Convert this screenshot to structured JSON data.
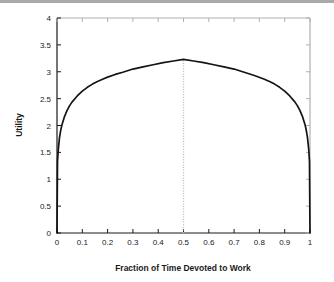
{
  "figure": {
    "background_color": "#ffffff",
    "top_band_color": "#a9a9a9",
    "frame_color": "#b0b0b0",
    "axis_color": "#1a1a1a"
  },
  "chart_data": {
    "type": "line",
    "title": "",
    "subtitle": "",
    "xlabel": "Fraction of Time Devoted to Work",
    "ylabel": "Utility",
    "xlim": [
      0,
      1
    ],
    "ylim": [
      0,
      4
    ],
    "grid": false,
    "legend": null,
    "legend_position": "none",
    "xticks": [
      0,
      0.1,
      0.2,
      0.3,
      0.4,
      0.5,
      0.6,
      0.7,
      0.8,
      0.9,
      1
    ],
    "xticklabels": [
      "0",
      "0.1",
      "0.2",
      "0.3",
      "0.4",
      "0.5",
      "0.6",
      "0.7",
      "0.8",
      "0.9",
      "1"
    ],
    "yticks": [
      0,
      0.5,
      1,
      1.5,
      2,
      2.5,
      3,
      3.5,
      4
    ],
    "yticklabels": [
      "0",
      "0.5",
      "1",
      "1.5",
      "2",
      "2.5",
      "3",
      "3.5",
      "4"
    ],
    "series": [
      {
        "name": "Utility",
        "color": "#141414",
        "linewidth": 1.7,
        "linestyle": "solid",
        "x": [
          0.0,
          0.002,
          0.005,
          0.01,
          0.015,
          0.02,
          0.03,
          0.04,
          0.05,
          0.06,
          0.08,
          0.1,
          0.12,
          0.14,
          0.16,
          0.18,
          0.2,
          0.23,
          0.26,
          0.3,
          0.34,
          0.38,
          0.42,
          0.46,
          0.5,
          0.54,
          0.58,
          0.62,
          0.66,
          0.7,
          0.74,
          0.78,
          0.82,
          0.84,
          0.86,
          0.88,
          0.9,
          0.92,
          0.94,
          0.95,
          0.96,
          0.97,
          0.98,
          0.985,
          0.99,
          0.995,
          0.998,
          1.0
        ],
        "y": [
          0.0,
          1.33,
          1.55,
          1.78,
          1.92,
          2.02,
          2.17,
          2.28,
          2.37,
          2.44,
          2.55,
          2.64,
          2.71,
          2.77,
          2.82,
          2.86,
          2.9,
          2.95,
          2.99,
          3.05,
          3.09,
          3.13,
          3.17,
          3.2,
          3.23,
          3.2,
          3.17,
          3.13,
          3.09,
          3.05,
          2.99,
          2.93,
          2.86,
          2.82,
          2.77,
          2.71,
          2.64,
          2.55,
          2.44,
          2.37,
          2.28,
          2.17,
          2.02,
          1.92,
          1.78,
          1.55,
          1.33,
          0.0
        ]
      }
    ],
    "annotations": [
      {
        "name": "optimum-marker",
        "type": "vertical-line",
        "x": 0.5,
        "y_from": 0,
        "y_to": 3.23,
        "linestyle": "dotted",
        "color": "#b8b8b8",
        "label": ""
      }
    ],
    "peak": {
      "x": 0.5,
      "y": 3.23
    }
  }
}
